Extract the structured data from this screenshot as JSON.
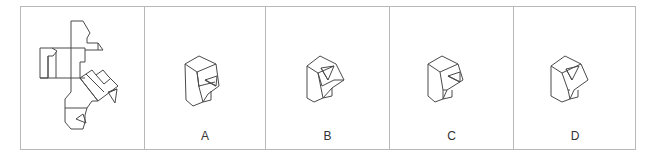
{
  "question": {
    "type": "cube-net folding puzzle",
    "net_panel": {
      "name": "unfolded-net"
    },
    "options": [
      {
        "label": "A"
      },
      {
        "label": "B"
      },
      {
        "label": "C"
      },
      {
        "label": "D"
      }
    ]
  },
  "colors": {
    "border": "#b8b8b8",
    "stroke": "#4a4a4a",
    "label": "#333333"
  }
}
